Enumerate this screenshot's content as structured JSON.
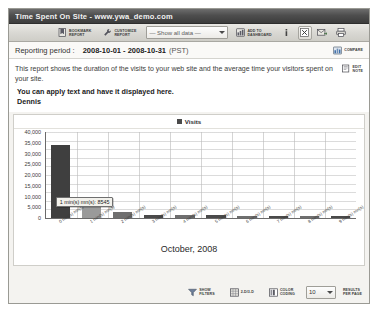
{
  "window": {
    "title": "Time Spent On Site - www.ywa_demo.com"
  },
  "toolbar": {
    "bookmark_report": {
      "line1": "BOOKMARK",
      "line2": "REPORT",
      "icon": "bookmark-icon"
    },
    "customize_report": {
      "line1": "CUSTOMIZE",
      "line2": "REPORT",
      "icon": "wrench-icon"
    },
    "data_filter": {
      "selected": "— Show all data —",
      "options": [
        "— Show all data —"
      ]
    },
    "add_to_dashboard": {
      "line1": "ADD TO",
      "line2": "DASHBOARD",
      "icon": "dashboard-icon"
    },
    "icons": [
      {
        "name": "help-icon",
        "glyph": "i"
      },
      {
        "name": "export-excel-icon",
        "glyph": "x"
      },
      {
        "name": "email-report-icon",
        "glyph": "mail"
      },
      {
        "name": "print-report-icon",
        "glyph": "printer"
      }
    ]
  },
  "reporting_period": {
    "label": "Reporting period :",
    "value": "2008-10-01 - 2008-10-31",
    "timezone": "(PST)",
    "compare_label": "COMPARE",
    "compare_icon": "compare-icon"
  },
  "description": {
    "text": "This report shows the duration of the visits to your web site and the average time your visitors spent on your site.",
    "edit_note": {
      "line1": "EDIT",
      "line2": "NOTE",
      "icon": "edit-note-icon"
    }
  },
  "note": {
    "line1": "You can apply text and have it displayed here.",
    "line2": "Dennis"
  },
  "chart_data": {
    "type": "bar",
    "title": "",
    "legend": [
      "Visits"
    ],
    "legend_position": "top-center",
    "xlabel": "October, 2008",
    "ylabel": "",
    "grid": true,
    "ylim": [
      0,
      40000
    ],
    "yticks": [
      "0",
      "5,000",
      "10,000",
      "15,000",
      "20,000",
      "25,000",
      "30,000",
      "35,000",
      "40,000"
    ],
    "ytick_values": [
      0,
      5000,
      10000,
      15000,
      20000,
      25000,
      30000,
      35000,
      40000
    ],
    "categories": [
      "0 min(s) mn(s)",
      "1 min(s) mn(s)",
      "2 min(s) mn(s)",
      "3 min(s) mn(s)",
      "4 min(s) mn(s)",
      "5 min(s) mn(s)",
      "6 min(s) mn(s)",
      "7 min(s) mn(s)",
      "8 min(s) mn(s)",
      "9 min(s) mn(s)"
    ],
    "series": [
      {
        "name": "Visits",
        "values": [
          34000,
          8545,
          3000,
          1500,
          1300,
          1200,
          1100,
          1000,
          900,
          850
        ]
      }
    ],
    "bar_colors": [
      "#3f3f3f",
      "#9a9a9a",
      "#6f6f6f",
      "#4a4a4a",
      "#6f6f6f",
      "#4a4a4a",
      "#6f6f6f",
      "#4a4a4a",
      "#6f6f6f",
      "#4a4a4a"
    ],
    "tooltip": {
      "text": "1 min(s) mn(s): 8545",
      "category": "1 min(s) mn(s)",
      "value": 8545
    }
  },
  "footer": {
    "show_filters": {
      "line1": "SHOW",
      "line2": "FILTERS",
      "icon": "filter-icon"
    },
    "dimension_toggle": {
      "line1": "2-D/3-D",
      "line2": "",
      "icon": "cube-icon"
    },
    "color_coding": {
      "line1": "COLOR",
      "line2": "CODING",
      "icon": "palette-icon"
    },
    "results_per_page": {
      "value": "10",
      "options": [
        "10"
      ],
      "line1": "RESULTS",
      "line2": "PER PAGE"
    }
  }
}
